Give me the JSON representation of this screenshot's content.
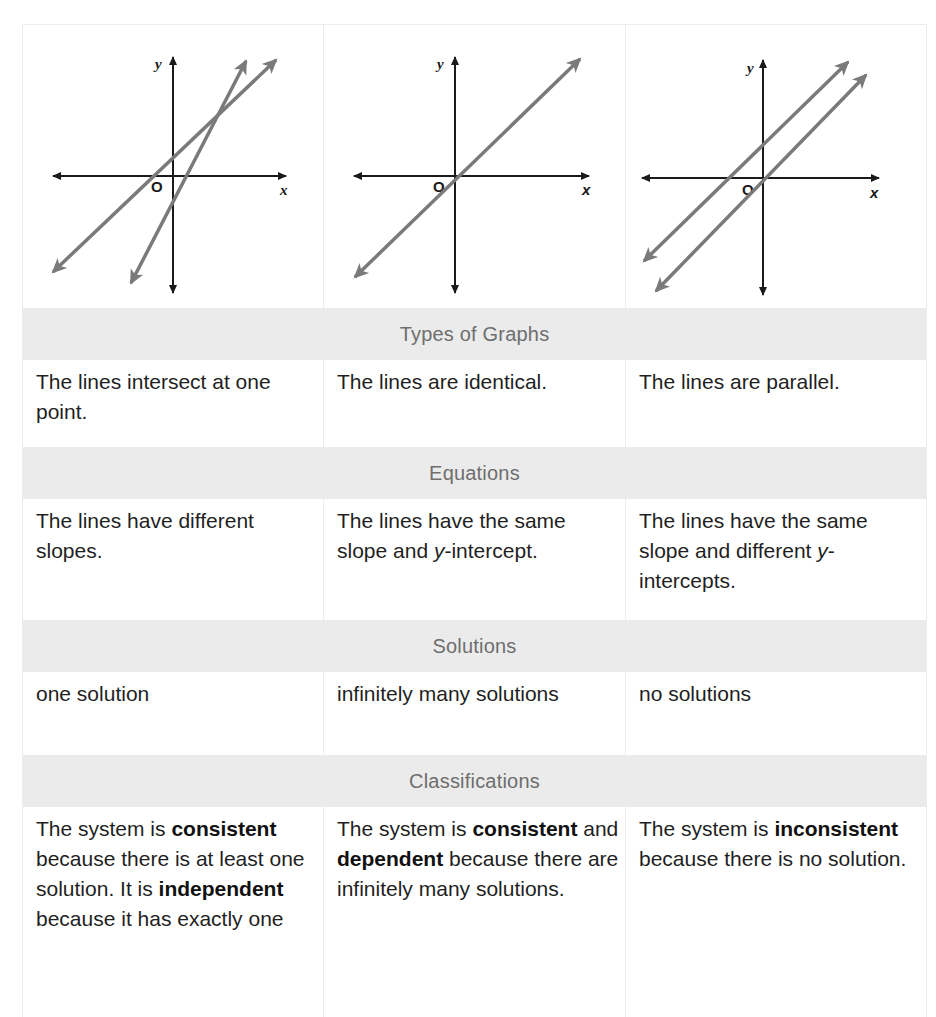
{
  "graphs": [
    {
      "id": "intersecting",
      "y_label": "y",
      "x_label": "x",
      "origin_label": "O",
      "description": "Two lines with different slopes crossing at one point"
    },
    {
      "id": "identical",
      "y_label": "y",
      "x_label": "x",
      "origin_label": "O",
      "description": "Two coincident lines drawn as one"
    },
    {
      "id": "parallel",
      "y_label": "y",
      "x_label": "x",
      "origin_label": "O",
      "description": "Two parallel lines with different y-intercepts"
    }
  ],
  "sections": {
    "types": {
      "heading": "Types of Graphs",
      "cells": [
        {
          "text": "The lines intersect at one point."
        },
        {
          "text": "The lines are identical."
        },
        {
          "text": "The lines are parallel."
        }
      ]
    },
    "equations": {
      "heading": "Equations",
      "cells": [
        {
          "text": "The lines have different slopes."
        },
        {
          "pre": "The lines have the same slope and ",
          "italic": "y",
          "post": "-intercept."
        },
        {
          "pre": "The lines have the same slope and different ",
          "italic": "y",
          "post": "-intercepts."
        }
      ]
    },
    "solutions": {
      "heading": "Solutions",
      "cells": [
        {
          "text": "one solution"
        },
        {
          "text": "infinitely many solutions"
        },
        {
          "text": "no solutions"
        }
      ]
    },
    "classifications": {
      "heading": "Classifications",
      "cells": [
        {
          "p1": "The system is ",
          "b1": "consistent",
          "p2": " because there is at least one solution. It is ",
          "b2": "independent",
          "p3": " because it has exactly one"
        },
        {
          "p1": "The system is ",
          "b1": "consistent",
          "p2": " and ",
          "b2": "dependent",
          "p3": " because there are infinitely many solutions."
        },
        {
          "p1": "The system is ",
          "b1": "inconsistent",
          "p2": " because there is no solution."
        }
      ]
    }
  },
  "colors": {
    "band_bg": "#ebebeb",
    "band_text": "#6e6e6e",
    "line_gray": "#7a7a7a",
    "axis": "#1a1a1a"
  }
}
